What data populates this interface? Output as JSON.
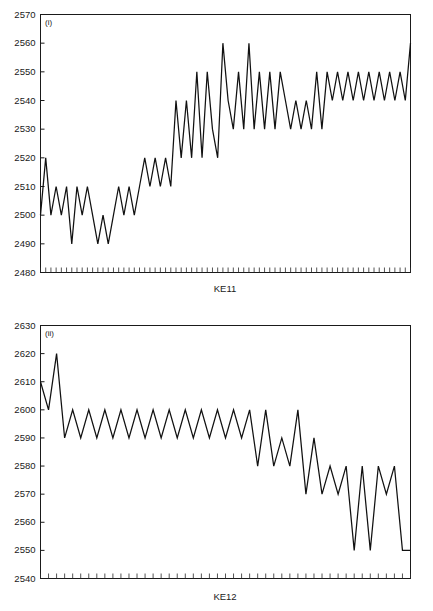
{
  "figure": {
    "background": "#ffffff",
    "line_color": "#111111",
    "axis_color": "#1a1a1a"
  },
  "chart_data": [
    {
      "type": "line",
      "panel_tag": "(i)",
      "title": "",
      "xlabel": "KE11",
      "ylabel": "",
      "ylim": [
        2480,
        2570
      ],
      "ytick_labels": [
        "2480",
        "2490",
        "2500",
        "2510",
        "2520",
        "2530",
        "2540",
        "2550",
        "2560",
        "2570"
      ],
      "yticks": [
        2480,
        2490,
        2500,
        2510,
        2520,
        2530,
        2540,
        2550,
        2560,
        2570
      ],
      "grid": false,
      "legend": "none",
      "n_points": 89,
      "values": [
        2500,
        2520,
        2500,
        2510,
        2500,
        2510,
        2490,
        2510,
        2500,
        2510,
        2500,
        2490,
        2500,
        2490,
        2500,
        2510,
        2500,
        2510,
        2500,
        2510,
        2520,
        2510,
        2520,
        2510,
        2520,
        2510,
        2540,
        2520,
        2540,
        2520,
        2550,
        2520,
        2550,
        2530,
        2520,
        2560,
        2540,
        2530,
        2550,
        2530,
        2560,
        2530,
        2550,
        2530,
        2550,
        2530,
        2550,
        2540,
        2530,
        2540,
        2530,
        2540,
        2530,
        2550,
        2530,
        2550,
        2540,
        2550,
        2540,
        2550,
        2540,
        2550,
        2540,
        2550,
        2540,
        2550,
        2540,
        2550,
        2540,
        2550,
        2540,
        2560
      ]
    },
    {
      "type": "line",
      "panel_tag": "(ii)",
      "title": "",
      "xlabel": "KE12",
      "ylabel": "",
      "ylim": [
        2540,
        2630
      ],
      "ytick_labels": [
        "2540",
        "2550",
        "2560",
        "2570",
        "2580",
        "2590",
        "2600",
        "2610",
        "2620",
        "2630"
      ],
      "yticks": [
        2540,
        2550,
        2560,
        2570,
        2580,
        2590,
        2600,
        2610,
        2620,
        2630
      ],
      "grid": false,
      "legend": "none",
      "n_points": 58,
      "values": [
        2610,
        2600,
        2620,
        2590,
        2600,
        2590,
        2600,
        2590,
        2600,
        2590,
        2600,
        2590,
        2600,
        2590,
        2600,
        2590,
        2600,
        2590,
        2600,
        2590,
        2600,
        2590,
        2600,
        2590,
        2600,
        2590,
        2600,
        2580,
        2600,
        2580,
        2590,
        2580,
        2600,
        2570,
        2590,
        2570,
        2580,
        2570,
        2580,
        2550,
        2580,
        2550,
        2580,
        2570,
        2580,
        2550,
        2550
      ]
    }
  ]
}
